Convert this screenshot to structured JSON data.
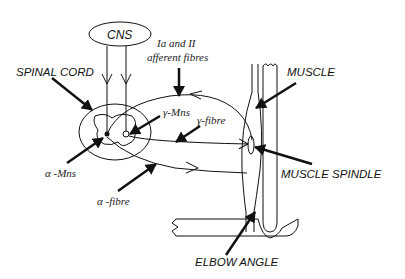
{
  "diagram": {
    "type": "stretch-reflex-loop schematic",
    "labels": {
      "cns": "CNS",
      "spinal_cord": "SPINAL CORD",
      "afferent_line1": "Ia and II",
      "afferent_line2": "afferent fibres",
      "gamma_mns": "γ-Mns",
      "gamma_fibre": "γ-fibre",
      "alpha_mns": "α -Mns",
      "alpha_fibre": "α -fibre",
      "muscle": "MUSCLE",
      "muscle_spindle": "MUSCLE SPINDLE",
      "elbow_angle": "ELBOW ANGLE"
    },
    "colors": {
      "stroke": "#111111",
      "background": "#ffffff"
    }
  }
}
